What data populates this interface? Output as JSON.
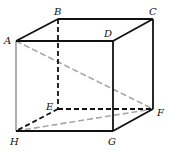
{
  "diagram": {
    "vertices": {
      "A": {
        "label": "A",
        "x": 16,
        "y": 41,
        "lx": 4,
        "ly": 44
      },
      "B": {
        "label": "B",
        "x": 58,
        "y": 19,
        "lx": 54,
        "ly": 15
      },
      "C": {
        "label": "C",
        "x": 153,
        "y": 19,
        "lx": 149,
        "ly": 15
      },
      "D": {
        "label": "D",
        "x": 113,
        "y": 41,
        "lx": 104,
        "ly": 37
      },
      "E": {
        "label": "E",
        "x": 58,
        "y": 109,
        "lx": 46,
        "ly": 110
      },
      "F": {
        "label": "F",
        "x": 153,
        "y": 109,
        "lx": 157,
        "ly": 116
      },
      "G": {
        "label": "G",
        "x": 113,
        "y": 131,
        "lx": 108,
        "ly": 145
      },
      "H": {
        "label": "H",
        "x": 16,
        "y": 131,
        "lx": 10,
        "ly": 145
      }
    },
    "edges_solid": [
      [
        "A",
        "B"
      ],
      [
        "B",
        "C"
      ],
      [
        "A",
        "D"
      ],
      [
        "C",
        "D"
      ],
      [
        "C",
        "F"
      ],
      [
        "D",
        "G"
      ],
      [
        "H",
        "G"
      ],
      [
        "G",
        "F"
      ]
    ],
    "edges_hidden": [
      [
        "B",
        "E"
      ],
      [
        "E",
        "F"
      ],
      [
        "E",
        "H"
      ]
    ],
    "edge_highlight": [
      [
        "A",
        "H"
      ]
    ],
    "diagonals_dashed": [
      [
        "A",
        "F"
      ],
      [
        "H",
        "F"
      ]
    ],
    "colors": {
      "edge": "#111111",
      "hidden_edge": "#111111",
      "highlight_edge": "#9a9a9a",
      "diagonal": "#a8a8a8",
      "background": "#ffffff"
    }
  }
}
